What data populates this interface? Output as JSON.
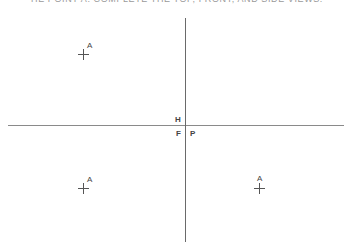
{
  "title": "HE POINT A. COMPLETE THE TOP, FRONT, AND SIDE VIEWS.",
  "planes": {
    "horizontal": "H",
    "frontal": "F",
    "profile": "P"
  },
  "points": [
    {
      "label": "A",
      "view": "top",
      "x": 83,
      "y": 54
    },
    {
      "label": "A",
      "view": "front",
      "x": 83,
      "y": 188
    },
    {
      "label": "A",
      "view": "side",
      "x": 259,
      "y": 188
    }
  ],
  "colors": {
    "lines": "#8a8a8a",
    "text": "#444444"
  }
}
